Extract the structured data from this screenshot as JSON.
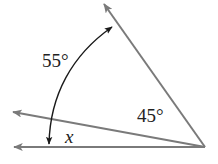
{
  "diagram": {
    "type": "angle-figure",
    "colors": {
      "ray": "#7a7a7a",
      "arc": "#1a1a1a",
      "text": "#222222",
      "background": "#ffffff"
    },
    "vertex": {
      "x": 205,
      "y": 147
    },
    "rays": [
      {
        "id": "upper-ray",
        "to": {
          "x": 103,
          "y": 2
        }
      },
      {
        "id": "middle-ray",
        "to": {
          "x": 12,
          "y": 112
        }
      },
      {
        "id": "bottom-ray",
        "to": {
          "x": 13,
          "y": 147
        }
      }
    ],
    "labels": {
      "angle_55": "55°",
      "angle_45": "45°",
      "angle_x": "x"
    }
  }
}
